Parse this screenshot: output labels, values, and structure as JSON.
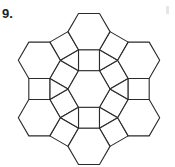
{
  "problem_number": "9.",
  "figure": {
    "center": [
      89,
      89
    ],
    "edge": 21,
    "stroke": "#2a2a2a",
    "stroke_width": 1.1,
    "fill": "#ffffff"
  }
}
